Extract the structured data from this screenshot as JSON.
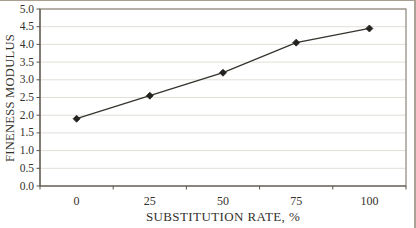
{
  "chart_data": {
    "type": "line",
    "title": "",
    "xlabel": "SUBSTITUTION RATE, %",
    "ylabel": "FINENESS MODULUS",
    "x": [
      0,
      25,
      50,
      75,
      100
    ],
    "x_tick_labels": [
      "0",
      "25",
      "50",
      "75",
      "100"
    ],
    "values": [
      1.9,
      2.55,
      3.2,
      4.05,
      4.45
    ],
    "y_ticks": [
      0.0,
      0.5,
      1.0,
      1.5,
      2.0,
      2.5,
      3.0,
      3.5,
      4.0,
      4.5,
      5.0
    ],
    "y_tick_labels": [
      "0.0",
      "0.5",
      "1.0",
      "1.5",
      "2.0",
      "2.5",
      "3.0",
      "3.5",
      "4.0",
      "4.5",
      "5.0"
    ],
    "ylim": [
      0,
      5
    ],
    "grid": "horizontal",
    "legend": "none",
    "marker": "diamond",
    "colors": {
      "background": "#ffffff",
      "line": "#35332e",
      "marker": "#23221e",
      "plot_border": "#8a857a",
      "axis": "#5a564d",
      "gridline": "#e2dfd8",
      "text": "#34312b",
      "outer_border": "#a89f90"
    }
  }
}
